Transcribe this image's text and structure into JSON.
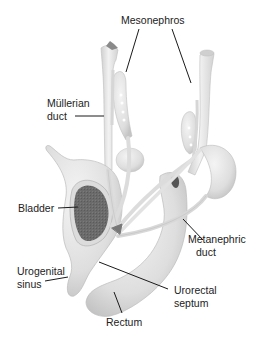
{
  "diagram": {
    "type": "anatomical-illustration",
    "colors": {
      "tissue": "#e6e6e6",
      "tissue_shadow": "#c9c9c9",
      "tissue_highlight": "#f5f5f5",
      "bladder_interior": "#6b6b6b",
      "leader_line": "#1a1a1a",
      "text": "#222222"
    },
    "labels": {
      "mesonephros": "Mesonephros",
      "mullerian_line1": "Müllerian",
      "mullerian_line2": "duct",
      "bladder": "Bladder",
      "metanephric_line1": "Metanephric",
      "metanephric_line2": "duct",
      "urogenital_line1": "Urogenital",
      "urogenital_line2": "sinus",
      "urorectal_line1": "Urorectal",
      "urorectal_line2": "septum",
      "rectum": "Rectum"
    }
  }
}
